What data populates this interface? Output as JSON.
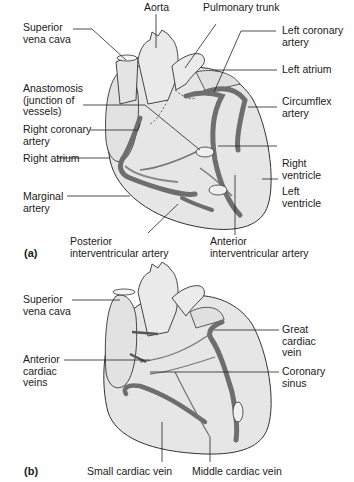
{
  "figure_a": {
    "panel_label": "(a)",
    "labels": {
      "aorta": "Aorta",
      "pulmonary_trunk": "Pulmonary trunk",
      "superior_vena_cava_1": "Superior",
      "superior_vena_cava_2": "vena cava",
      "anastomosis_1": "Anastomosis",
      "anastomosis_2": "(junction of",
      "anastomosis_3": "vessels)",
      "right_coronary_1": "Right coronary",
      "right_coronary_2": "artery",
      "right_atrium": "Right atrium",
      "marginal_1": "Marginal",
      "marginal_2": "artery",
      "posterior_iv_1": "Posterior",
      "posterior_iv_2": "interventricular artery",
      "left_coronary_1": "Left coronary",
      "left_coronary_2": "artery",
      "left_atrium": "Left atrium",
      "circumflex_1": "Circumflex",
      "circumflex_2": "artery",
      "right_ventricle_1": "Right",
      "right_ventricle_2": "ventricle",
      "left_ventricle_1": "Left",
      "left_ventricle_2": "ventricle",
      "anterior_iv_1": "Anterior",
      "anterior_iv_2": "interventricular artery"
    }
  },
  "figure_b": {
    "panel_label": "(b)",
    "labels": {
      "superior_vena_cava_1": "Superior",
      "superior_vena_cava_2": "vena cava",
      "anterior_cardiac_1": "Anterior",
      "anterior_cardiac_2": "cardiac",
      "anterior_cardiac_3": "veins",
      "great_cardiac_1": "Great",
      "great_cardiac_2": "cardiac",
      "great_cardiac_3": "vein",
      "coronary_sinus_1": "Coronary",
      "coronary_sinus_2": "sinus",
      "small_cardiac": "Small cardiac vein",
      "middle_cardiac": "Middle cardiac vein"
    }
  },
  "colors": {
    "heart_fill": "#e6e6e6",
    "vessel": "#6e6e6e",
    "outline": "#333333",
    "leader_line": "#222222"
  }
}
